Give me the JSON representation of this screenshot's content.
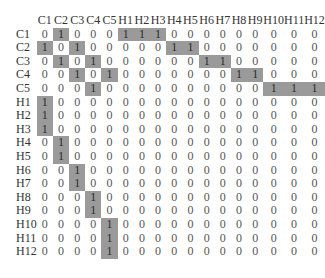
{
  "matrix": {
    "highlight_color": "#9a9a9a",
    "columns": [
      "C1",
      "C2",
      "C3",
      "C4",
      "C5",
      "H1",
      "H2",
      "H3",
      "H4",
      "H5",
      "H6",
      "H7",
      "H8",
      "H9",
      "H10",
      "H11",
      "H12"
    ],
    "rows": [
      {
        "label": "C1",
        "values": [
          0,
          1,
          0,
          0,
          0,
          1,
          1,
          1,
          0,
          0,
          0,
          0,
          0,
          0,
          0,
          0,
          0
        ]
      },
      {
        "label": "C2",
        "values": [
          1,
          0,
          1,
          0,
          0,
          0,
          0,
          0,
          1,
          1,
          0,
          0,
          0,
          0,
          0,
          0,
          0
        ]
      },
      {
        "label": "C3",
        "values": [
          0,
          1,
          0,
          1,
          0,
          0,
          0,
          0,
          0,
          0,
          1,
          1,
          0,
          0,
          0,
          0,
          0
        ]
      },
      {
        "label": "C4",
        "values": [
          0,
          0,
          1,
          0,
          1,
          0,
          0,
          0,
          0,
          0,
          0,
          0,
          1,
          1,
          0,
          0,
          0
        ]
      },
      {
        "label": "C5",
        "values": [
          0,
          0,
          0,
          1,
          0,
          0,
          0,
          0,
          0,
          0,
          0,
          0,
          0,
          0,
          1,
          1,
          1
        ]
      },
      {
        "label": "H1",
        "values": [
          1,
          0,
          0,
          0,
          0,
          0,
          0,
          0,
          0,
          0,
          0,
          0,
          0,
          0,
          0,
          0,
          0
        ]
      },
      {
        "label": "H2",
        "values": [
          1,
          0,
          0,
          0,
          0,
          0,
          0,
          0,
          0,
          0,
          0,
          0,
          0,
          0,
          0,
          0,
          0
        ]
      },
      {
        "label": "H3",
        "values": [
          1,
          0,
          0,
          0,
          0,
          0,
          0,
          0,
          0,
          0,
          0,
          0,
          0,
          0,
          0,
          0,
          0
        ]
      },
      {
        "label": "H4",
        "values": [
          0,
          1,
          0,
          0,
          0,
          0,
          0,
          0,
          0,
          0,
          0,
          0,
          0,
          0,
          0,
          0,
          0
        ]
      },
      {
        "label": "H5",
        "values": [
          0,
          1,
          0,
          0,
          0,
          0,
          0,
          0,
          0,
          0,
          0,
          0,
          0,
          0,
          0,
          0,
          0
        ]
      },
      {
        "label": "H6",
        "values": [
          0,
          0,
          1,
          0,
          0,
          0,
          0,
          0,
          0,
          0,
          0,
          0,
          0,
          0,
          0,
          0,
          0
        ]
      },
      {
        "label": "H7",
        "values": [
          0,
          0,
          1,
          0,
          0,
          0,
          0,
          0,
          0,
          0,
          0,
          0,
          0,
          0,
          0,
          0,
          0
        ]
      },
      {
        "label": "H8",
        "values": [
          0,
          0,
          0,
          1,
          0,
          0,
          0,
          0,
          0,
          0,
          0,
          0,
          0,
          0,
          0,
          0,
          0
        ]
      },
      {
        "label": "H9",
        "values": [
          0,
          0,
          0,
          1,
          0,
          0,
          0,
          0,
          0,
          0,
          0,
          0,
          0,
          0,
          0,
          0,
          0
        ]
      },
      {
        "label": "H10",
        "values": [
          0,
          0,
          0,
          0,
          1,
          0,
          0,
          0,
          0,
          0,
          0,
          0,
          0,
          0,
          0,
          0,
          0
        ]
      },
      {
        "label": "H11",
        "values": [
          0,
          0,
          0,
          0,
          1,
          0,
          0,
          0,
          0,
          0,
          0,
          0,
          0,
          0,
          0,
          0,
          0
        ]
      },
      {
        "label": "H12",
        "values": [
          0,
          0,
          0,
          0,
          1,
          0,
          0,
          0,
          0,
          0,
          0,
          0,
          0,
          0,
          0,
          0,
          0
        ]
      }
    ]
  }
}
